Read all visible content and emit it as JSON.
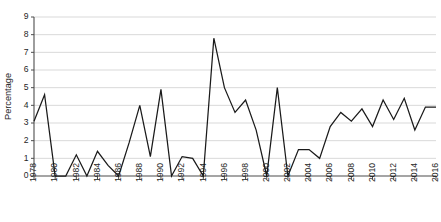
{
  "chart_data": {
    "type": "line",
    "title": "",
    "xlabel": "",
    "ylabel": "Percentage",
    "x": [
      1978,
      1979,
      1980,
      1981,
      1982,
      1983,
      1984,
      1985,
      1986,
      1987,
      1988,
      1989,
      1990,
      1991,
      1992,
      1993,
      1994,
      1995,
      1996,
      1997,
      1998,
      1999,
      2000,
      2001,
      2002,
      2003,
      2004,
      2005,
      2006,
      2007,
      2008,
      2009,
      2010,
      2011,
      2012,
      2013,
      2014,
      2015,
      2016
    ],
    "values": [
      3.1,
      4.6,
      0,
      0,
      1.2,
      0,
      1.4,
      0.6,
      0,
      1.9,
      4.0,
      1.1,
      4.9,
      0,
      1.1,
      1.0,
      0,
      7.8,
      5.0,
      3.6,
      4.3,
      2.6,
      0,
      5.0,
      0,
      1.5,
      1.5,
      1.0,
      2.8,
      3.6,
      3.1,
      3.8,
      2.8,
      4.3,
      3.2,
      4.4,
      2.6,
      3.9,
      3.9
    ],
    "series": [
      {
        "name": "Percentage",
        "values": [
          3.1,
          4.6,
          0,
          0,
          1.2,
          0,
          1.4,
          0.6,
          0,
          1.9,
          4.0,
          1.1,
          4.9,
          0,
          1.1,
          1.0,
          0,
          7.8,
          5.0,
          3.6,
          4.3,
          2.6,
          0,
          5.0,
          0,
          1.5,
          1.5,
          1.0,
          2.8,
          3.6,
          3.1,
          3.8,
          2.8,
          4.3,
          3.2,
          4.4,
          2.6,
          3.9,
          3.9
        ]
      }
    ],
    "ylim": [
      0,
      9
    ],
    "xlim": [
      1978,
      2016
    ],
    "yticks": [
      0,
      1,
      2,
      3,
      4,
      5,
      6,
      7,
      8,
      9
    ],
    "ytick_labels": [
      "0",
      "1",
      "2",
      "3",
      "4",
      "5",
      "6",
      "7",
      "8",
      "9"
    ],
    "xticks": [
      1978,
      1980,
      1982,
      1984,
      1986,
      1988,
      1990,
      1992,
      1994,
      1996,
      1998,
      2000,
      2002,
      2004,
      2006,
      2008,
      2010,
      2012,
      2014,
      2016
    ],
    "xtick_labels": [
      "1978",
      "1980",
      "1982",
      "1984",
      "1986",
      "1988",
      "1990",
      "1992",
      "1994",
      "1996",
      "1998",
      "2000",
      "2002",
      "2004",
      "2006",
      "2008",
      "2010",
      "2012",
      "2014",
      "2016"
    ],
    "grid": true,
    "grid_axis": "y",
    "legend": false,
    "legend_position": "none",
    "line_color": "#1a1a1a",
    "grid_color": "#c9c9c9",
    "axis_color": "#4d4d4d",
    "background": "#ffffff",
    "annotations": []
  },
  "caption": {
    "text": ""
  }
}
